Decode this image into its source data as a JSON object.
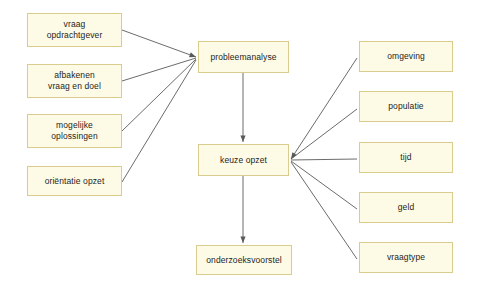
{
  "diagram": {
    "background_color": "#ffffff",
    "node_fill_color": "#fdfbe6",
    "node_border_color": "#d9cc8c",
    "edge_color": "#5a5a5a",
    "text_color": "#1d1d1d",
    "nodes": [
      {
        "id": "vraag-opdrachtgever",
        "label": "vraag\nopdrachtgever",
        "x": 27,
        "y": 13,
        "w": 95,
        "h": 34
      },
      {
        "id": "afbakenen-vraag-doel",
        "label": "afbakenen\nvraag en doel",
        "x": 27,
        "y": 64,
        "w": 95,
        "h": 34
      },
      {
        "id": "mogelijke-oplossingen",
        "label": "mogelijke\noplossingen",
        "x": 27,
        "y": 114,
        "w": 95,
        "h": 34
      },
      {
        "id": "orientatie-opzet",
        "label": "oriëntatie opzet",
        "x": 27,
        "y": 166,
        "w": 95,
        "h": 30
      },
      {
        "id": "probleemanalyse",
        "label": "probleemanalyse",
        "x": 198,
        "y": 41,
        "w": 91,
        "h": 32
      },
      {
        "id": "keuze-opzet",
        "label": "keuze opzet",
        "x": 198,
        "y": 144,
        "w": 91,
        "h": 32
      },
      {
        "id": "onderzoeksvoorstel",
        "label": "onderzoeksvoorstel",
        "x": 196,
        "y": 245,
        "w": 96,
        "h": 30
      },
      {
        "id": "omgeving",
        "label": "omgeving",
        "x": 359,
        "y": 41,
        "w": 94,
        "h": 31
      },
      {
        "id": "populatie",
        "label": "populatie",
        "x": 359,
        "y": 91,
        "w": 94,
        "h": 31
      },
      {
        "id": "tijd",
        "label": "tijd",
        "x": 359,
        "y": 142,
        "w": 94,
        "h": 31
      },
      {
        "id": "geld",
        "label": "geld",
        "x": 359,
        "y": 192,
        "w": 94,
        "h": 31
      },
      {
        "id": "vraagtype",
        "label": "vraagtype",
        "x": 359,
        "y": 242,
        "w": 94,
        "h": 31
      }
    ],
    "edges": [
      {
        "from": "vraag-opdrachtgever",
        "to": "probleemanalyse",
        "x1": 122,
        "y1": 30,
        "x2": 196,
        "y2": 57,
        "arrow": true
      },
      {
        "from": "afbakenen-vraag-doel",
        "to": "probleemanalyse",
        "x1": 122,
        "y1": 81,
        "x2": 196,
        "y2": 58,
        "arrow": false
      },
      {
        "from": "mogelijke-oplossingen",
        "to": "probleemanalyse",
        "x1": 122,
        "y1": 131,
        "x2": 196,
        "y2": 59,
        "arrow": false
      },
      {
        "from": "orientatie-opzet",
        "to": "probleemanalyse",
        "x1": 122,
        "y1": 182,
        "x2": 196,
        "y2": 60,
        "arrow": false
      },
      {
        "from": "probleemanalyse",
        "to": "keuze-opzet",
        "x1": 243,
        "y1": 73,
        "x2": 243,
        "y2": 142,
        "arrow": true
      },
      {
        "from": "keuze-opzet",
        "to": "onderzoeksvoorstel",
        "x1": 243,
        "y1": 176,
        "x2": 243,
        "y2": 243,
        "arrow": true
      },
      {
        "from": "omgeving",
        "to": "keuze-opzet",
        "x1": 357,
        "y1": 58,
        "x2": 291,
        "y2": 159,
        "arrow": true
      },
      {
        "from": "populatie",
        "to": "keuze-opzet",
        "x1": 357,
        "y1": 109,
        "x2": 291,
        "y2": 159,
        "arrow": false
      },
      {
        "from": "tijd",
        "to": "keuze-opzet",
        "x1": 357,
        "y1": 159,
        "x2": 291,
        "y2": 160,
        "arrow": false
      },
      {
        "from": "geld",
        "to": "keuze-opzet",
        "x1": 357,
        "y1": 209,
        "x2": 291,
        "y2": 161,
        "arrow": false
      },
      {
        "from": "vraagtype",
        "to": "keuze-opzet",
        "x1": 357,
        "y1": 259,
        "x2": 291,
        "y2": 162,
        "arrow": false
      }
    ]
  }
}
